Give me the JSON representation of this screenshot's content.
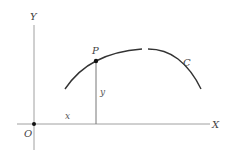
{
  "diagram": {
    "type": "coordinate-plane-curve",
    "axes": {
      "x_label": "X",
      "y_label": "Y",
      "origin_label": "O"
    },
    "curve": {
      "label": "C",
      "description": "Concave-down arc rising through P to a maximum, then descending"
    },
    "point": {
      "label": "P",
      "ordinate_label": "y",
      "abscissa_label": "x"
    },
    "colors": {
      "axis": "#9a9a9a",
      "curve": "#333333",
      "point": "#111111",
      "text": "#444444"
    }
  }
}
